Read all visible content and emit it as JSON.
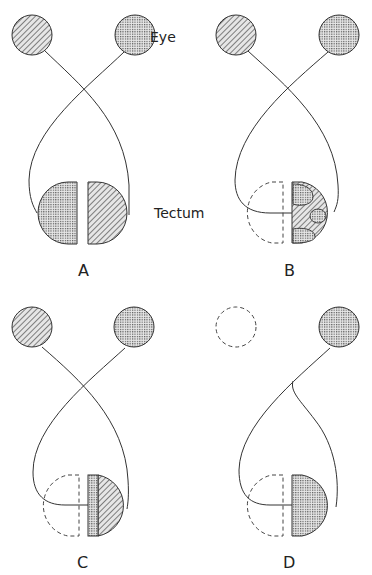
{
  "labels": {
    "eye": "Eye",
    "tectum": "Tectum"
  },
  "panels": [
    {
      "id": "A",
      "label": "A",
      "left_eye": "hatched",
      "right_eye": "dotted",
      "left_tectum": "dotted",
      "right_tectum": "hatched"
    },
    {
      "id": "B",
      "label": "B",
      "left_eye": "hatched",
      "right_eye": "dotted",
      "left_tectum": "removed (dashed)",
      "right_tectum": "hatched with dotted patches"
    },
    {
      "id": "C",
      "label": "C",
      "left_eye": "hatched",
      "right_eye": "dotted",
      "left_tectum": "removed (dashed)",
      "right_tectum": "dotted strip + hatched"
    },
    {
      "id": "D",
      "label": "D",
      "left_eye": "removed (dashed)",
      "right_eye": "dotted",
      "left_tectum": "removed (dashed)",
      "right_tectum": "dotted"
    }
  ],
  "colors": {
    "stroke": "#333333",
    "fill_bg": "#d9d9d9",
    "background": "#ffffff"
  }
}
